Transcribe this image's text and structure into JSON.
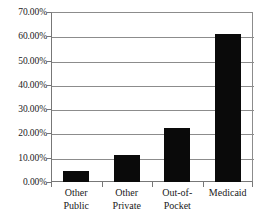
{
  "chart_data": {
    "type": "bar",
    "title": "",
    "xlabel": "",
    "ylabel": "",
    "categories": [
      "Other Public",
      "Other Private",
      "Out-of-Pocket",
      "Medicaid"
    ],
    "category_lines": [
      [
        "Other",
        "Public"
      ],
      [
        "Other",
        "Private"
      ],
      [
        "Out-of-",
        "Pocket"
      ],
      [
        "Medicaid",
        ""
      ]
    ],
    "values": [
      4.5,
      11.2,
      22.2,
      61.0
    ],
    "ylim": [
      0,
      70
    ],
    "ytick_values": [
      0,
      10,
      20,
      30,
      40,
      50,
      60,
      70
    ],
    "ytick_labels": [
      "0.00%",
      "10.00%",
      "20.00%",
      "30.00%",
      "40.00%",
      "50.00%",
      "60.00%",
      "70.00%"
    ],
    "grid": true,
    "legend": false,
    "legend_position": "none",
    "bar_color": "#0a0a0a",
    "gridline_color": "#8c8c8c",
    "axis_color": "#777777",
    "background_color": "#ffffff"
  }
}
